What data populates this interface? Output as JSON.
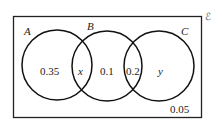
{
  "diagram": {
    "type": "venn",
    "universal_symbol": "ℰ",
    "sets": [
      {
        "label": "A"
      },
      {
        "label": "B"
      },
      {
        "label": "C"
      }
    ],
    "regions": {
      "A_only": "0.35",
      "A_and_B": "x",
      "B_only": "0.1",
      "B_and_C": "0.2",
      "C_only": "y",
      "outside": "0.05"
    }
  }
}
